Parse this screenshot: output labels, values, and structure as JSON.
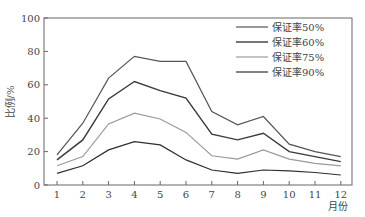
{
  "chart_data": {
    "type": "line",
    "title": "",
    "xlabel": "月份",
    "ylabel": "比例/%",
    "ylim": [
      0,
      100
    ],
    "yticks": [
      0,
      20,
      40,
      60,
      80,
      100
    ],
    "categories": [
      "1",
      "2",
      "3",
      "4",
      "5",
      "6",
      "7",
      "8",
      "9",
      "10",
      "11",
      "12"
    ],
    "grid": false,
    "legend_position": "upper right",
    "series": [
      {
        "name": "保证率50%",
        "color": "#555555",
        "width": 1.2,
        "values": [
          18,
          37,
          64,
          77,
          74,
          74,
          44,
          36,
          41,
          24.5,
          20,
          17
        ]
      },
      {
        "name": "保证率60%",
        "color": "#3a3a3a",
        "width": 1.4,
        "values": [
          15,
          27,
          51.5,
          62,
          56.5,
          52,
          30.5,
          27,
          31,
          20,
          17,
          14
        ]
      },
      {
        "name": "保证率75%",
        "color": "#9a9a9a",
        "width": 1.2,
        "values": [
          11.5,
          17,
          36.5,
          43,
          39.5,
          31.5,
          17.5,
          15.5,
          21,
          15.5,
          13,
          11.5
        ]
      },
      {
        "name": "保证率90%",
        "color": "#2e2e2e",
        "width": 1.2,
        "values": [
          7,
          11.5,
          21,
          26,
          24,
          15,
          9,
          7,
          9,
          8.5,
          7.5,
          6
        ]
      }
    ]
  }
}
